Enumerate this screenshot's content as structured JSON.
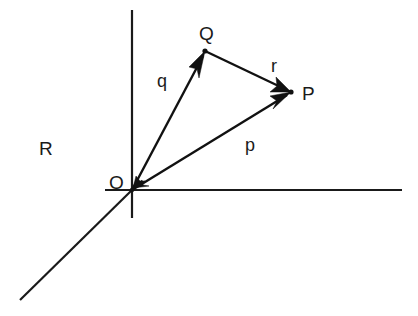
{
  "diagram": {
    "title": "",
    "region_label": "R",
    "origin": {
      "label": "O",
      "x": 132,
      "y": 190
    },
    "points": [
      {
        "id": "Q",
        "label": "Q",
        "x": 205,
        "y": 51
      },
      {
        "id": "P",
        "label": "P",
        "x": 291,
        "y": 92
      }
    ],
    "vectors": [
      {
        "id": "q",
        "label": "q",
        "from": "O",
        "to": "Q"
      },
      {
        "id": "p",
        "label": "p",
        "from": "O",
        "to": "P"
      },
      {
        "id": "r",
        "label": "r",
        "from": "Q",
        "to": "P"
      }
    ],
    "axes": [
      {
        "id": "vertical",
        "x1": 132,
        "y1": 10,
        "x2": 132,
        "y2": 218
      },
      {
        "id": "horizontal",
        "x1": 105,
        "y1": 190,
        "x2": 402,
        "y2": 190
      },
      {
        "id": "diagonal",
        "x1": 132,
        "y1": 190,
        "x2": 20,
        "y2": 300
      }
    ],
    "colors": {
      "line": "#111111",
      "background": "#ffffff"
    }
  }
}
